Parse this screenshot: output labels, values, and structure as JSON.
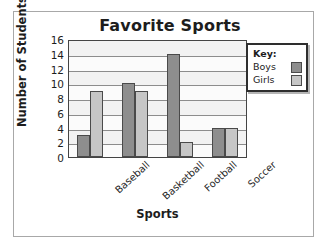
{
  "chart_data": {
    "type": "bar",
    "title": "Favorite Sports",
    "xlabel": "Sports",
    "ylabel": "Number of Students",
    "categories": [
      "Baseball",
      "Basketball",
      "Football",
      "Soccer"
    ],
    "series": [
      {
        "name": "Boys",
        "values": [
          3,
          10,
          14,
          4
        ],
        "color": "#8e8e8e"
      },
      {
        "name": "Girls",
        "values": [
          9,
          9,
          2,
          4
        ],
        "color": "#c6c6c6"
      }
    ],
    "ylim": [
      0,
      16
    ],
    "yticks": [
      0,
      2,
      4,
      6,
      8,
      10,
      12,
      14,
      16
    ],
    "ytick_labels": [
      "0",
      "2",
      "4",
      "6",
      "8",
      "10",
      "12",
      "14",
      "16"
    ],
    "grid": true,
    "legend_position": "top-right",
    "legend_title": "Key:"
  },
  "legend": {
    "title": "Key:",
    "entries": [
      {
        "label": "Boys",
        "color": "#8e8e8e"
      },
      {
        "label": "Girls",
        "color": "#c6c6c6"
      }
    ]
  },
  "colors": {
    "boys": "#8e8e8e",
    "girls": "#c6c6c6",
    "bar_edge": "#4a4a4a",
    "axis": "#444444",
    "grid": "#8c8c8c",
    "text": "#1d1d1d",
    "plot_background": "#fbfbfb",
    "frame": "#a8a8a8"
  }
}
